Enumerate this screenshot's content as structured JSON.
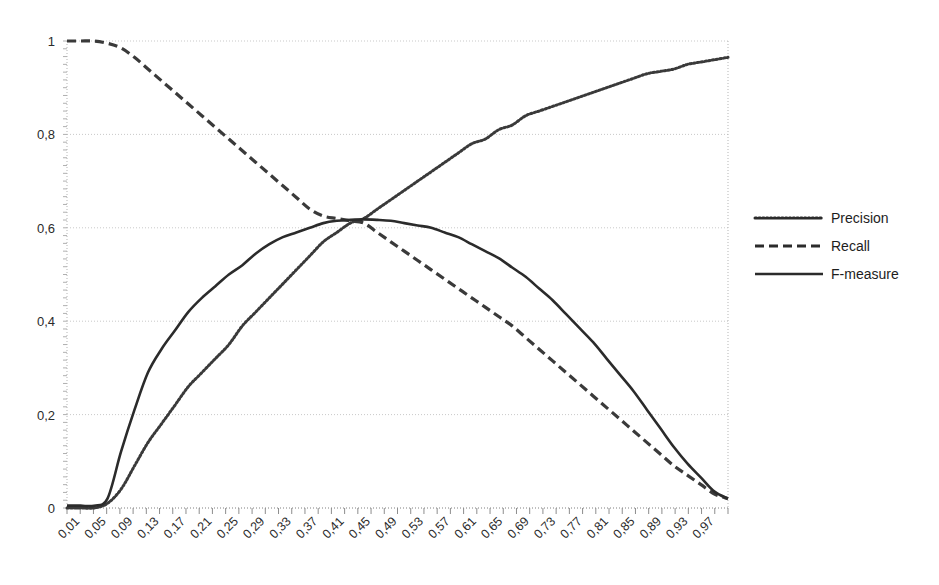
{
  "chart_data": {
    "type": "line",
    "title": "",
    "xlabel": "",
    "ylabel": "",
    "xlim": [
      0.01,
      0.99
    ],
    "ylim": [
      0,
      1
    ],
    "grid": true,
    "legend_position": "right",
    "decimal_separator": ",",
    "y_ticks": [
      "0",
      "0,2",
      "0,4",
      "0,6",
      "0,8",
      "1"
    ],
    "y_tick_values": [
      0,
      0.2,
      0.4,
      0.6,
      0.8,
      1
    ],
    "x_tick_labels": [
      "0,01",
      "0,05",
      "0,09",
      "0,13",
      "0,17",
      "0,21",
      "0,25",
      "0,29",
      "0,33",
      "0,37",
      "0,41",
      "0,45",
      "0,49",
      "0,53",
      "0,57",
      "0,61",
      "0,65",
      "0,69",
      "0,73",
      "0,77",
      "0,81",
      "0,85",
      "0,89",
      "0,93",
      "0,97"
    ],
    "x": [
      0.01,
      0.03,
      0.05,
      0.07,
      0.09,
      0.11,
      0.13,
      0.15,
      0.17,
      0.19,
      0.21,
      0.23,
      0.25,
      0.27,
      0.29,
      0.31,
      0.33,
      0.35,
      0.37,
      0.39,
      0.41,
      0.43,
      0.45,
      0.47,
      0.49,
      0.51,
      0.53,
      0.55,
      0.57,
      0.59,
      0.61,
      0.63,
      0.65,
      0.67,
      0.69,
      0.71,
      0.73,
      0.75,
      0.77,
      0.79,
      0.81,
      0.83,
      0.85,
      0.87,
      0.89,
      0.91,
      0.93,
      0.95,
      0.97,
      0.99
    ],
    "series": [
      {
        "name": "Precision",
        "style": "dotted",
        "color": "#3a3a3a",
        "values": [
          0.0,
          0.0,
          0.0,
          0.01,
          0.04,
          0.09,
          0.14,
          0.18,
          0.22,
          0.26,
          0.29,
          0.32,
          0.35,
          0.39,
          0.42,
          0.45,
          0.48,
          0.51,
          0.54,
          0.57,
          0.59,
          0.61,
          0.62,
          0.64,
          0.66,
          0.68,
          0.7,
          0.72,
          0.74,
          0.76,
          0.78,
          0.79,
          0.81,
          0.82,
          0.84,
          0.85,
          0.86,
          0.87,
          0.88,
          0.89,
          0.9,
          0.91,
          0.92,
          0.93,
          0.935,
          0.94,
          0.95,
          0.955,
          0.96,
          0.965
        ]
      },
      {
        "name": "Recall",
        "style": "dashed",
        "color": "#3a3a3a",
        "values": [
          1.0,
          1.0,
          1.0,
          0.995,
          0.985,
          0.965,
          0.94,
          0.915,
          0.89,
          0.865,
          0.84,
          0.815,
          0.79,
          0.765,
          0.74,
          0.715,
          0.69,
          0.665,
          0.64,
          0.625,
          0.62,
          0.615,
          0.61,
          0.59,
          0.57,
          0.55,
          0.53,
          0.51,
          0.49,
          0.47,
          0.45,
          0.43,
          0.41,
          0.39,
          0.365,
          0.34,
          0.315,
          0.29,
          0.265,
          0.24,
          0.215,
          0.19,
          0.165,
          0.14,
          0.115,
          0.09,
          0.07,
          0.05,
          0.03,
          0.02
        ]
      },
      {
        "name": "F-measure",
        "style": "solid",
        "color": "#2b2b2b",
        "values": [
          0.005,
          0.005,
          0.005,
          0.02,
          0.12,
          0.21,
          0.29,
          0.34,
          0.38,
          0.42,
          0.45,
          0.475,
          0.5,
          0.52,
          0.545,
          0.565,
          0.58,
          0.59,
          0.6,
          0.61,
          0.615,
          0.617,
          0.618,
          0.617,
          0.615,
          0.61,
          0.605,
          0.6,
          0.59,
          0.58,
          0.565,
          0.55,
          0.535,
          0.515,
          0.495,
          0.47,
          0.445,
          0.415,
          0.385,
          0.355,
          0.32,
          0.285,
          0.25,
          0.21,
          0.17,
          0.13,
          0.095,
          0.065,
          0.035,
          0.02
        ]
      }
    ],
    "legend": [
      {
        "label": "Precision",
        "style": "dotted"
      },
      {
        "label": "Recall",
        "style": "dashed"
      },
      {
        "label": "F-measure",
        "style": "solid"
      }
    ]
  }
}
